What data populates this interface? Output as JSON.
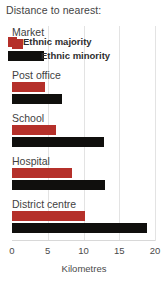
{
  "chart_data": {
    "type": "bar",
    "orientation": "horizontal",
    "title": "Distance to nearest:",
    "xlabel": "Kilometres",
    "ylabel": "",
    "xlim": [
      0,
      20
    ],
    "xticks": [
      0,
      5,
      10,
      15,
      20
    ],
    "grid": true,
    "legend_position": "top-left",
    "categories": [
      "Market",
      "Post office",
      "School",
      "Hospital",
      "District centre"
    ],
    "series": [
      {
        "name": "Ethnic majority",
        "color": "#b5302a",
        "values": [
          1.5,
          4.6,
          6.2,
          8.4,
          10.2
        ]
      },
      {
        "name": "Ethnic minority",
        "color": "#100f0d",
        "values": [
          4.5,
          7.0,
          12.8,
          13.0,
          18.9
        ]
      }
    ]
  },
  "legend": {
    "items": [
      {
        "label": "Ethnic majority",
        "swatch": "red-square-swatch"
      },
      {
        "label": "Ethnic minority",
        "swatch": "black-bar-swatch"
      }
    ]
  }
}
